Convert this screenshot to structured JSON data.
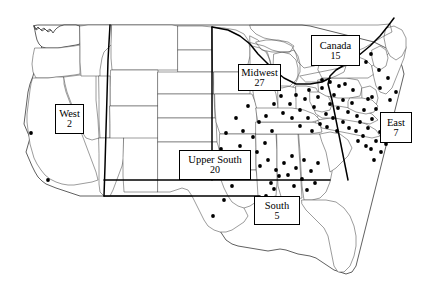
{
  "figure": {
    "kind": "thematic-point-map",
    "basemap": "united-states-and-southern-canada",
    "point_symbol": "filled-black-dot",
    "colors": {
      "background": "#ffffff",
      "state_border": "#4a4a4a",
      "coastline": "#2b2b2b",
      "region_divider": "#000000",
      "point": "#000000",
      "label_box_border": "#000000",
      "label_text": "#000000"
    }
  },
  "chart_data": {
    "type": "scatter",
    "title": "",
    "xlabel": "",
    "ylabel": "",
    "categories": [
      "West",
      "Midwest",
      "Upper South",
      "South",
      "East",
      "Canada"
    ],
    "values": [
      2,
      27,
      20,
      5,
      7,
      15
    ],
    "total": 76,
    "series": [
      {
        "name": "Region counts",
        "values": [
          2,
          27,
          20,
          5,
          7,
          15
        ]
      }
    ],
    "legend_position": "inline-boxed-labels-on-map",
    "grid": false
  },
  "regions": [
    {
      "id": "west",
      "name": "West",
      "count": "2",
      "box": {
        "left": 55,
        "top": 104,
        "width": 29,
        "height": 30
      }
    },
    {
      "id": "midwest",
      "name": "Midwest",
      "count": "27",
      "box": {
        "left": 238,
        "top": 64,
        "width": 43,
        "height": 27
      }
    },
    {
      "id": "canada",
      "name": "Canada",
      "count": "15",
      "box": {
        "left": 311,
        "top": 35,
        "width": 49,
        "height": 31
      }
    },
    {
      "id": "east",
      "name": "East",
      "count": "7",
      "box": {
        "left": 380,
        "top": 112,
        "width": 32,
        "height": 31
      }
    },
    {
      "id": "upper-south",
      "name": "Upper South",
      "count": "20",
      "box": {
        "left": 179,
        "top": 150,
        "width": 72,
        "height": 30
      }
    },
    {
      "id": "south",
      "name": "South",
      "count": "5",
      "box": {
        "left": 254,
        "top": 196,
        "width": 46,
        "height": 29
      }
    }
  ],
  "points": [
    [
      31,
      133
    ],
    [
      48,
      180
    ],
    [
      213,
      216
    ],
    [
      196,
      175
    ],
    [
      185,
      160
    ],
    [
      221,
      149
    ],
    [
      226,
      133
    ],
    [
      236,
      118
    ],
    [
      248,
      106
    ],
    [
      243,
      131
    ],
    [
      240,
      146
    ],
    [
      253,
      137
    ],
    [
      259,
      122
    ],
    [
      247,
      158
    ],
    [
      257,
      152
    ],
    [
      265,
      143
    ],
    [
      272,
      131
    ],
    [
      266,
      116
    ],
    [
      274,
      104
    ],
    [
      281,
      96
    ],
    [
      283,
      113
    ],
    [
      290,
      104
    ],
    [
      296,
      95
    ],
    [
      292,
      118
    ],
    [
      300,
      110
    ],
    [
      305,
      99
    ],
    [
      309,
      90
    ],
    [
      300,
      126
    ],
    [
      308,
      118
    ],
    [
      314,
      107
    ],
    [
      318,
      97
    ],
    [
      322,
      88
    ],
    [
      312,
      131
    ],
    [
      320,
      124
    ],
    [
      326,
      114
    ],
    [
      330,
      104
    ],
    [
      334,
      95
    ],
    [
      327,
      127
    ],
    [
      333,
      118
    ],
    [
      338,
      108
    ],
    [
      343,
      100
    ],
    [
      337,
      131
    ],
    [
      343,
      122
    ],
    [
      348,
      112
    ],
    [
      339,
      86
    ],
    [
      330,
      82
    ],
    [
      322,
      80
    ],
    [
      345,
      84
    ],
    [
      353,
      90
    ],
    [
      352,
      103
    ],
    [
      357,
      116
    ],
    [
      349,
      128
    ],
    [
      356,
      131
    ],
    [
      360,
      122
    ],
    [
      364,
      110
    ],
    [
      368,
      99
    ],
    [
      358,
      141
    ],
    [
      363,
      136
    ],
    [
      368,
      128
    ],
    [
      372,
      119
    ],
    [
      376,
      109
    ],
    [
      372,
      97
    ],
    [
      380,
      88
    ],
    [
      366,
      146
    ],
    [
      371,
      149
    ],
    [
      376,
      141
    ],
    [
      380,
      132
    ],
    [
      384,
      123
    ],
    [
      374,
      160
    ],
    [
      381,
      152
    ],
    [
      386,
      144
    ],
    [
      390,
      100
    ],
    [
      396,
      92
    ],
    [
      388,
      78
    ],
    [
      379,
      70
    ],
    [
      366,
      62
    ],
    [
      355,
      56
    ],
    [
      344,
      50
    ],
    [
      333,
      45
    ],
    [
      371,
      54
    ],
    [
      260,
      166
    ],
    [
      268,
      160
    ],
    [
      276,
      170
    ],
    [
      284,
      163
    ],
    [
      292,
      156
    ],
    [
      288,
      175
    ],
    [
      296,
      168
    ],
    [
      304,
      160
    ],
    [
      271,
      183
    ],
    [
      279,
      176
    ],
    [
      294,
      186
    ],
    [
      302,
      179
    ],
    [
      266,
      196
    ],
    [
      274,
      189
    ],
    [
      311,
      171
    ],
    [
      318,
      163
    ],
    [
      307,
      190
    ],
    [
      315,
      183
    ],
    [
      288,
      199
    ],
    [
      259,
      208
    ],
    [
      284,
      211
    ],
    [
      247,
      176
    ],
    [
      238,
      166
    ],
    [
      232,
      186
    ],
    [
      224,
      200
    ]
  ]
}
